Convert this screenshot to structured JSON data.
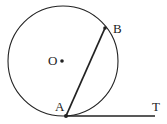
{
  "diagram": {
    "colors": {
      "stroke": "#222222",
      "background": "#ffffff"
    },
    "circle": {
      "center_label": "O",
      "cx": 63,
      "cy": 61,
      "r": 55
    },
    "points": {
      "O": {
        "label": "O",
        "x": 62,
        "y": 61
      },
      "A": {
        "label": "A",
        "x": 66,
        "y": 116
      },
      "B": {
        "label": "B",
        "x": 105,
        "y": 28
      },
      "T": {
        "label": "T",
        "x": 155,
        "y": 116
      }
    },
    "segments": [
      {
        "name": "chord-AB",
        "from": "A",
        "to": "B"
      },
      {
        "name": "tangent-AT",
        "from": "A",
        "to": "T"
      }
    ]
  }
}
